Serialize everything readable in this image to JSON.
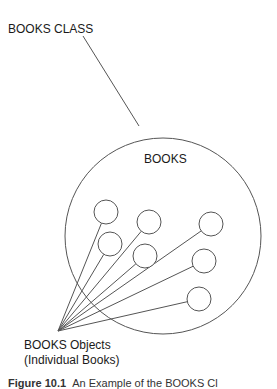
{
  "diagram": {
    "class_label": "BOOKS CLASS",
    "circle_label": "BOOKS",
    "objects_label_line1": "BOOKS Objects",
    "objects_label_line2": "(Individual Books)",
    "caption_prefix": "Figure 10.1",
    "caption_text": "An Example of the BOOKS Cl",
    "stroke_color": "#555555",
    "big_circle": {
      "cx": 163,
      "cy": 236,
      "r": 98
    },
    "pointer_line": {
      "x1": 83,
      "y1": 36,
      "x2": 139,
      "y2": 126
    },
    "convergence_point": {
      "x": 58,
      "y": 331
    },
    "objects": [
      {
        "cx": 106,
        "cy": 212,
        "r": 12
      },
      {
        "cx": 149,
        "cy": 222,
        "r": 12
      },
      {
        "cx": 211,
        "cy": 224,
        "r": 12
      },
      {
        "cx": 110,
        "cy": 244,
        "r": 12
      },
      {
        "cx": 145,
        "cy": 256,
        "r": 12
      },
      {
        "cx": 204,
        "cy": 261,
        "r": 12
      },
      {
        "cx": 199,
        "cy": 299,
        "r": 12
      }
    ]
  }
}
